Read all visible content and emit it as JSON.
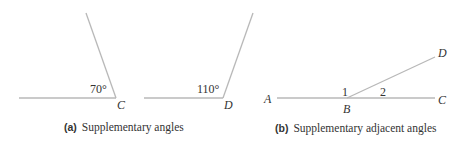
{
  "figure_a": {
    "tag": "(a)",
    "caption": "Supplementary angles",
    "angle_1": {
      "value_label": "70°",
      "vertex_label": "C"
    },
    "angle_2": {
      "value_label": "110°",
      "vertex_label": "D"
    }
  },
  "figure_b": {
    "tag": "(b)",
    "caption": "Supplementary adjacent angles",
    "points": {
      "A": "A",
      "B": "B",
      "C": "C",
      "D": "D"
    },
    "angles": {
      "one": "1",
      "two": "2"
    }
  },
  "colors": {
    "line": "#b8b8b8",
    "text": "#333333",
    "background": "#ffffff"
  }
}
